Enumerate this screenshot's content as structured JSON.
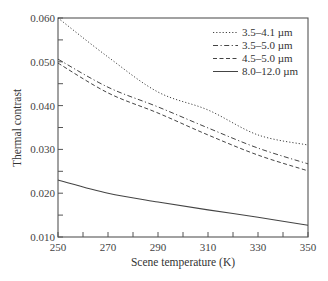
{
  "chart_data": {
    "type": "line",
    "title": "",
    "xlabel": "Scene temperature (K)",
    "ylabel": "Thermal contrast",
    "xlim": [
      250,
      350
    ],
    "ylim": [
      0.01,
      0.06
    ],
    "xticks": [
      250,
      270,
      290,
      310,
      330,
      350
    ],
    "xtick_labels": [
      "250",
      "270",
      "290",
      "310",
      "330",
      "350"
    ],
    "xminor_step": 10,
    "yticks": [
      0.01,
      0.02,
      0.03,
      0.04,
      0.05,
      0.06
    ],
    "ytick_labels": [
      "0.010",
      "0.020",
      "0.030",
      "0.040",
      "0.050",
      "0.060"
    ],
    "yminor_step": 0.005,
    "grid": false,
    "legend_position": "upper right",
    "x": [
      250,
      270,
      290,
      310,
      330,
      350
    ],
    "series": [
      {
        "name": "3.5–4.1 µm",
        "style": "dotted",
        "values": [
          0.06,
          0.0511,
          0.0431,
          0.039,
          0.0333,
          0.031
        ]
      },
      {
        "name": "3.5–5.0 µm",
        "style": "dash-dot",
        "values": [
          0.0506,
          0.0442,
          0.0397,
          0.0349,
          0.0303,
          0.0267
        ]
      },
      {
        "name": "4.5–5.0 µm",
        "style": "dashed",
        "values": [
          0.0497,
          0.0429,
          0.0383,
          0.0333,
          0.0287,
          0.0251
        ]
      },
      {
        "name": "8.0–12.0 µm",
        "style": "solid",
        "values": [
          0.023,
          0.02,
          0.018,
          0.0162,
          0.0145,
          0.0127
        ]
      }
    ],
    "colors": {
      "line": "#444444",
      "axis": "#555555",
      "text": "#333333"
    }
  }
}
